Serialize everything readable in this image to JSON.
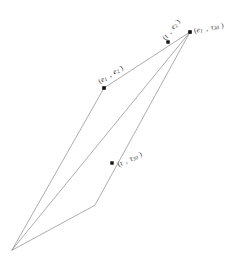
{
  "figure": {
    "background_color": "#ffffff",
    "stroke_color": "#8a8a8a",
    "marker_color": "#101010",
    "text_color": "#2b2b2b",
    "width": 238,
    "height": 259,
    "outline_points": "12,250 104,88 190,32 95,205",
    "diagonal_points": "12,250 190,32",
    "markers": [
      {
        "name": "marker-e1-e2",
        "x": 104,
        "y": 88,
        "size": 3.6
      },
      {
        "name": "marker-t-e2",
        "x": 168,
        "y": 42,
        "size": 3.4
      },
      {
        "name": "marker-e1-tau30",
        "x": 190,
        "y": 32,
        "size": 3.6
      },
      {
        "name": "marker-t-tau30",
        "x": 112,
        "y": 163,
        "size": 3.4
      }
    ],
    "labels": [
      {
        "name": "label-e1-e2",
        "open": "(",
        "first": "e",
        "first_sub": "1",
        "comma": ",",
        "second": "e",
        "second_sub": "2",
        "close": ")",
        "x": 99,
        "y": 78,
        "rotation": -32
      },
      {
        "name": "label-t-e2",
        "open": "(",
        "first": "t",
        "first_sub": "",
        "comma": ",",
        "second": "e",
        "second_sub": "2",
        "close": ")",
        "x": 164,
        "y": 35,
        "rotation": -52
      },
      {
        "name": "label-e1-tau30",
        "open": "(",
        "first": "e",
        "first_sub": "1",
        "comma": ",",
        "second": "τ",
        "second_sub": "30",
        "close": ")",
        "x": 194,
        "y": 27,
        "rotation": -11
      },
      {
        "name": "label-t-tau30",
        "open": "(",
        "first": "t",
        "first_sub": "",
        "comma": ",",
        "second": "τ",
        "second_sub": "30",
        "close": ")",
        "x": 118,
        "y": 161,
        "rotation": -25
      }
    ]
  }
}
